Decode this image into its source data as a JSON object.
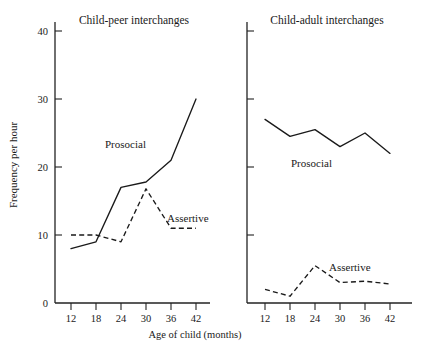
{
  "figure": {
    "y_axis_title": "Frequency per hour",
    "x_axis_title": "Age of child (months)"
  },
  "chart_data": {
    "type": "line",
    "title": "",
    "xlabel": "Age of child (months)",
    "ylabel": "Frequency per hour",
    "xlim": [
      9,
      45
    ],
    "ylim": [
      0,
      44
    ],
    "x": [
      12,
      18,
      24,
      30,
      36,
      42
    ],
    "xticks": [
      "12",
      "18",
      "24",
      "30",
      "36",
      "42"
    ],
    "yticks": [
      "0",
      "10",
      "20",
      "30",
      "40"
    ],
    "ytick_values": [
      0,
      10,
      20,
      30,
      40
    ],
    "grid": false,
    "legend_position": "inline-annotations",
    "panels": [
      {
        "name": "child-peer",
        "title": "Child-peer interchanges",
        "series": [
          {
            "name": "Prosocial",
            "label": "Prosocial",
            "style": "solid",
            "values": [
              8.0,
              9.0,
              17.0,
              17.8,
              21.0,
              30.0
            ]
          },
          {
            "name": "Assertive",
            "label": "Assertive",
            "style": "dashed",
            "values": [
              10.0,
              10.0,
              9.0,
              16.8,
              11.0,
              11.0
            ]
          }
        ]
      },
      {
        "name": "child-adult",
        "title": "Child-adult interchanges",
        "series": [
          {
            "name": "Prosocial",
            "label": "Prosocial",
            "style": "solid",
            "values": [
              27.0,
              24.5,
              25.5,
              23.0,
              25.0,
              22.0
            ]
          },
          {
            "name": "Assertive",
            "label": "Assertive",
            "style": "dashed",
            "values": [
              2.0,
              1.0,
              5.5,
              3.0,
              3.2,
              2.8
            ]
          }
        ]
      }
    ]
  }
}
